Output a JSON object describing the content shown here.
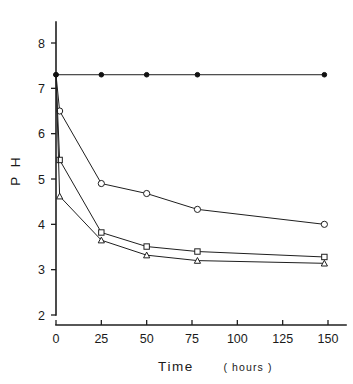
{
  "chart_data": {
    "type": "line",
    "title": "",
    "subtitle": "",
    "xlabel": "Time",
    "xlabel_unit": "( hours )",
    "xlabel_full": "Time  ( hours )",
    "ylabel": "P H",
    "xlim": [
      0,
      160
    ],
    "ylim": [
      2,
      8.4
    ],
    "xticks": [
      0,
      25,
      50,
      75,
      100,
      125,
      150
    ],
    "xticklabels": [
      "0",
      "25",
      "50",
      "75",
      "100",
      "125",
      "150"
    ],
    "yticks": [
      2,
      3,
      4,
      5,
      6,
      7,
      8
    ],
    "yticklabels": [
      "2",
      "3",
      "4",
      "5",
      "6",
      "7",
      "8"
    ],
    "grid": false,
    "legend": "none",
    "series": [
      {
        "name": "control",
        "marker": "filled-circle",
        "x": [
          0,
          25,
          50,
          78,
          148
        ],
        "values": [
          7.3,
          7.3,
          7.3,
          7.3,
          7.3
        ]
      },
      {
        "name": "upper-open-circle",
        "marker": "open-circle",
        "x": [
          0,
          2,
          25,
          50,
          78,
          148
        ],
        "values": [
          7.3,
          6.5,
          4.9,
          4.68,
          4.33,
          4.0
        ]
      },
      {
        "name": "middle-open-square",
        "marker": "open-square",
        "x": [
          0,
          2,
          25,
          50,
          78,
          148
        ],
        "values": [
          7.3,
          5.42,
          3.82,
          3.51,
          3.4,
          3.28
        ]
      },
      {
        "name": "lower-open-triangle",
        "marker": "open-triangle",
        "x": [
          0,
          2,
          25,
          50,
          78,
          148
        ],
        "values": [
          7.3,
          4.62,
          3.65,
          3.32,
          3.2,
          3.14
        ]
      }
    ]
  },
  "axes": {
    "x_title": "Time",
    "x_unit": "( hours )",
    "y_title": "P H"
  },
  "colors": {
    "ink": "#1f1f1f",
    "background": "#ffffff",
    "marker_fill": "#ffffff"
  }
}
